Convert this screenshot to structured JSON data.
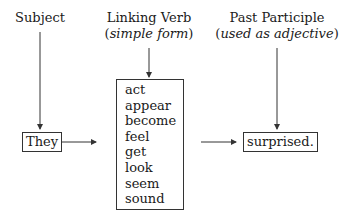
{
  "columns": {
    "subject": {
      "heading": "Subject"
    },
    "linking_verb": {
      "heading": "Linking Verb",
      "subheading_open": "(",
      "subheading_italic": "simple form",
      "subheading_close": ")"
    },
    "past_participle": {
      "heading": "Past Participle",
      "subheading_open": "(",
      "subheading_italic": "used as adjective",
      "subheading_close": ")"
    }
  },
  "subject_box": "They",
  "verbs": [
    "act",
    "appear",
    "become",
    "feel",
    "get",
    "look",
    "seem",
    "sound"
  ],
  "participle_box": "surprised.",
  "colors": {
    "line": "#333333",
    "text": "#1a1a1a",
    "background": "#ffffff"
  }
}
